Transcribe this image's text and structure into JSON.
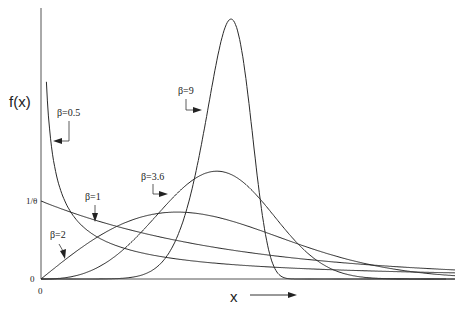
{
  "chart_data": {
    "type": "line",
    "title": "",
    "xlabel": "x",
    "ylabel": "f(x)",
    "y_tick_labels": [
      "0",
      "1/θ"
    ],
    "x_tick_labels": [
      "0"
    ],
    "grid": false,
    "legend_position": "inline annotations with arrows",
    "theta": 1,
    "x_range": [
      0,
      2.15
    ],
    "series": [
      {
        "name": "β=0.5",
        "beta": 0.5
      },
      {
        "name": "β=1",
        "beta": 1
      },
      {
        "name": "β=2",
        "beta": 2
      },
      {
        "name": "β=3.6",
        "beta": 3.6
      },
      {
        "name": "β=9",
        "beta": 9
      }
    ]
  },
  "labels": {
    "ylabel": "f(x)",
    "xlabel": "x",
    "y_one_over_theta": "1/θ",
    "y_zero": "0",
    "x_zero": "0",
    "beta_05": "β=0.5",
    "beta_1": "β=1",
    "beta_2": "β=2",
    "beta_36": "β=3.6",
    "beta_9": "β=9"
  },
  "colors": {
    "curve": "#2a2a2a",
    "axis": "#555555"
  }
}
